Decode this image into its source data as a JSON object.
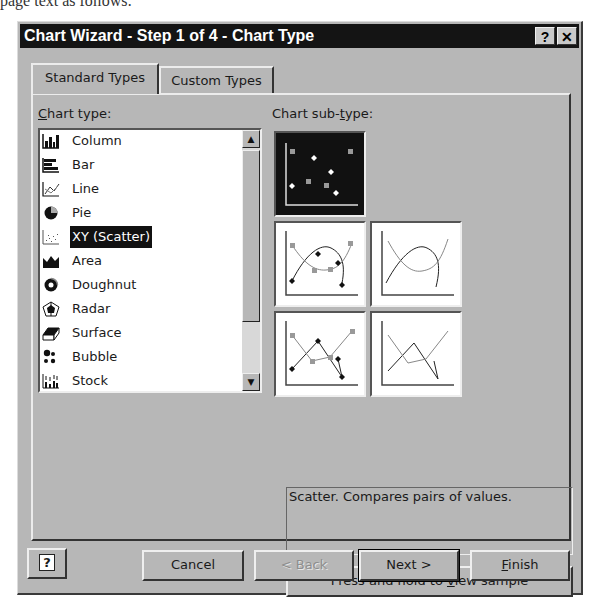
{
  "page": {
    "top_text": "page text as follows:"
  },
  "dialog": {
    "title": "Chart Wizard - Step 1 of 4 - Chart Type",
    "titlebar_buttons": {
      "help": "?",
      "close": "✕"
    },
    "tabs": [
      {
        "label": "Standard Types",
        "active": true
      },
      {
        "label": "Custom Types",
        "active": false
      }
    ],
    "chart_type_label": {
      "mnemonic": "C",
      "rest": "hart type:"
    },
    "chart_subtype_label": {
      "pre": "Chart sub-",
      "mnemonic": "t",
      "rest": "ype:"
    },
    "chart_types": [
      {
        "label": "Column",
        "icon": "column-chart-icon"
      },
      {
        "label": "Bar",
        "icon": "bar-chart-icon"
      },
      {
        "label": "Line",
        "icon": "line-chart-icon"
      },
      {
        "label": "Pie",
        "icon": "pie-chart-icon"
      },
      {
        "label": "XY (Scatter)",
        "icon": "scatter-chart-icon",
        "selected": true
      },
      {
        "label": "Area",
        "icon": "area-chart-icon"
      },
      {
        "label": "Doughnut",
        "icon": "doughnut-chart-icon"
      },
      {
        "label": "Radar",
        "icon": "radar-chart-icon"
      },
      {
        "label": "Surface",
        "icon": "surface-chart-icon"
      },
      {
        "label": "Bubble",
        "icon": "bubble-chart-icon"
      },
      {
        "label": "Stock",
        "icon": "stock-chart-icon"
      }
    ],
    "subtypes": [
      {
        "name": "scatter-markers-only",
        "selected": true
      },
      {
        "name": "scatter-smoothed-lines-markers"
      },
      {
        "name": "scatter-smoothed-lines"
      },
      {
        "name": "scatter-lines-markers"
      },
      {
        "name": "scatter-lines"
      }
    ],
    "description": "Scatter. Compares pairs of values.",
    "sample_button": {
      "pre": "Press and hold to ",
      "mnemonic": "v",
      "rest": "iew sample"
    },
    "buttons": {
      "help": "?",
      "cancel": "Cancel",
      "back": "< Back",
      "next": "Next >",
      "finish_mnemonic": "F",
      "finish_rest": "inish"
    }
  },
  "colors": {
    "face": "#b7b7b7",
    "titlebar": "#141414",
    "selection": "#111111"
  }
}
